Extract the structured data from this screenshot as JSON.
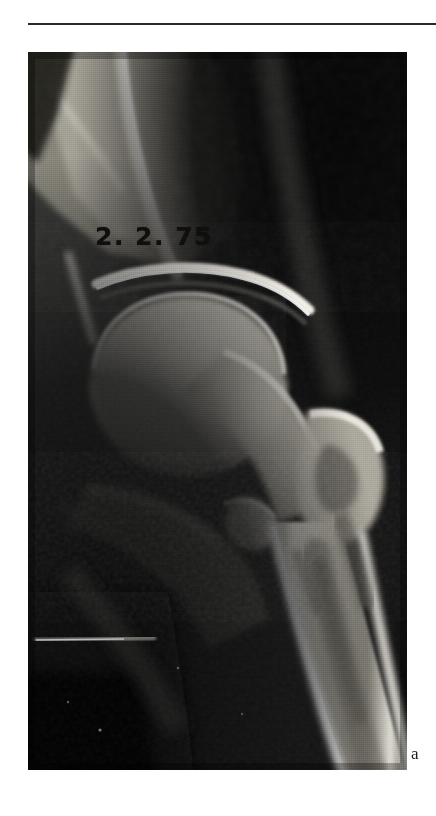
{
  "figure": {
    "domain": "radiograph",
    "modality": "plain-film-radiograph",
    "region": "hip-joint-anteroposterior",
    "part_label": "a",
    "date_stamp": "2. 2. 75",
    "rule": {
      "color": "#2b2b2b",
      "thickness_px": 2
    },
    "plate": {
      "background_color": "#0a0a0a",
      "bone_highlight_color": "#f2efe8",
      "soft_tissue_color": "#5a5a58",
      "air_color": "#070707",
      "width_px": 379,
      "height_px": 718
    },
    "anatomy_labels": [
      "ilium",
      "acetabulum",
      "joint-space",
      "femoral-head",
      "femoral-neck",
      "greater-trochanter",
      "lesser-trochanter",
      "femoral-shaft",
      "ischium",
      "obturator-foramen"
    ]
  }
}
